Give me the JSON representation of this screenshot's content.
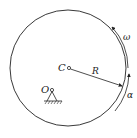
{
  "diagram": {
    "labels": {
      "center": "C",
      "pivot": "O",
      "radius": "R",
      "angular_velocity": "ω",
      "angular_acceleration": "α"
    },
    "colors": {
      "stroke": "#222222",
      "background": "#ffffff"
    }
  }
}
